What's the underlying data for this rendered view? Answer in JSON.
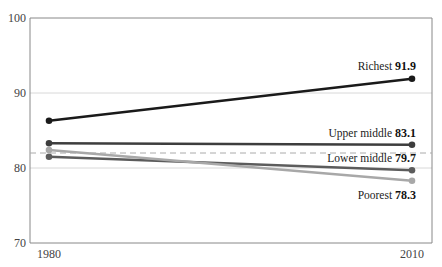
{
  "chart_data": {
    "type": "line",
    "title": "",
    "xlabel": "",
    "ylabel": "",
    "x": [
      1980,
      2010
    ],
    "x_tick_labels": [
      "1980",
      "2010"
    ],
    "y_tick_labels": [
      "70",
      "80",
      "90",
      "100"
    ],
    "ylim": [
      70,
      100
    ],
    "grid": true,
    "legend_position": "inline-right",
    "reference_line": {
      "value": 82.0,
      "style": "dashed"
    },
    "series": [
      {
        "name": "Richest",
        "values": [
          86.3,
          91.9
        ],
        "end_label": "91.9",
        "color": "#1a1a1a"
      },
      {
        "name": "Upper middle",
        "values": [
          83.3,
          83.1
        ],
        "end_label": "83.1",
        "color": "#3d3d3d"
      },
      {
        "name": "Lower middle",
        "values": [
          81.5,
          79.7
        ],
        "end_label": "79.7",
        "color": "#5c5c5c"
      },
      {
        "name": "Poorest",
        "values": [
          82.4,
          78.3
        ],
        "end_label": "78.3",
        "color": "#a8a8a8"
      }
    ]
  }
}
